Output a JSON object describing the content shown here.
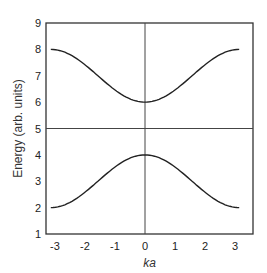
{
  "chart_data": {
    "type": "line",
    "title": "",
    "xlabel": "ka",
    "ylabel": "Energy (arb. units)",
    "xlim": [
      -3.3,
      3.6
    ],
    "ylim": [
      1,
      9
    ],
    "xticks": [
      "-3",
      "-2",
      "-1",
      "0",
      "1",
      "2",
      "3"
    ],
    "yticks": [
      "1",
      "2",
      "3",
      "4",
      "5",
      "6",
      "7",
      "8",
      "9"
    ],
    "grid": false,
    "reference_lines": {
      "vertical_x": 0,
      "horizontal_y": 5
    },
    "series": [
      {
        "name": "upper band",
        "x": [
          -3.14,
          -2,
          -1,
          0,
          1,
          2,
          3.14
        ],
        "values": [
          8.0,
          7.6,
          6.6,
          6.0,
          6.6,
          7.6,
          8.0
        ]
      },
      {
        "name": "lower band",
        "x": [
          -3.14,
          -2,
          -1,
          0,
          1,
          2,
          3.14
        ],
        "values": [
          2.0,
          2.4,
          3.4,
          4.0,
          3.4,
          2.4,
          2.0
        ]
      }
    ]
  }
}
